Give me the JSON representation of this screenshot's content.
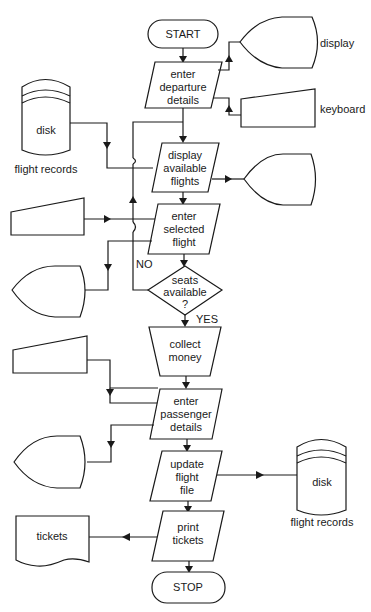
{
  "diagram": {
    "type": "system flowchart",
    "nodes": {
      "start": {
        "label": "START",
        "shape": "terminator"
      },
      "enter_departure": {
        "lines": [
          "enter",
          "departure",
          "details"
        ],
        "shape": "parallelogram"
      },
      "display_flights": {
        "lines": [
          "display",
          "available",
          "flights"
        ],
        "shape": "parallelogram"
      },
      "enter_selected": {
        "lines": [
          "enter",
          "selected",
          "flight"
        ],
        "shape": "parallelogram"
      },
      "seats_decision": {
        "lines": [
          "seats",
          "available",
          "?"
        ],
        "shape": "diamond"
      },
      "collect_money": {
        "lines": [
          "collect",
          "money"
        ],
        "shape": "manual-operation"
      },
      "enter_passenger": {
        "lines": [
          "enter",
          "passenger",
          "details"
        ],
        "shape": "parallelogram"
      },
      "update_file": {
        "lines": [
          "update",
          "flight",
          "file"
        ],
        "shape": "parallelogram"
      },
      "print_tickets": {
        "lines": [
          "print",
          "tickets"
        ],
        "shape": "parallelogram"
      },
      "stop": {
        "label": "STOP",
        "shape": "terminator"
      }
    },
    "peripherals": {
      "display_top": {
        "label": "display",
        "shape": "display"
      },
      "keyboard_top": {
        "label": "keyboard",
        "shape": "manual-input"
      },
      "disk_left": {
        "label": "disk",
        "caption": "flight records",
        "shape": "disk"
      },
      "display_right": {
        "label": "",
        "shape": "display"
      },
      "keyboard_mid": {
        "label": "",
        "shape": "manual-input"
      },
      "display_mid": {
        "label": "",
        "shape": "display"
      },
      "keyboard_low": {
        "label": "",
        "shape": "manual-input"
      },
      "display_low": {
        "label": "",
        "shape": "display"
      },
      "disk_right": {
        "label": "disk",
        "caption": "flight records",
        "shape": "disk"
      },
      "tickets_doc": {
        "label": "tickets",
        "shape": "document"
      }
    },
    "branch_labels": {
      "no": "NO",
      "yes": "YES"
    }
  }
}
